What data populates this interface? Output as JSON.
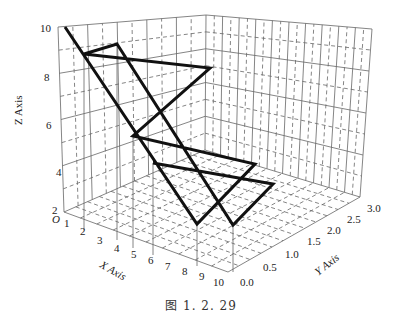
{
  "caption": "图 1. 2. 29",
  "axes": {
    "x_title": "X Axis",
    "y_title": "Y Axis",
    "z_title": "Z Axis",
    "origin_label": "O",
    "x_ticks": [
      "1",
      "2",
      "3",
      "4",
      "5",
      "6",
      "7",
      "8",
      "9",
      "10"
    ],
    "y_ticks": [
      "0.0",
      "0.5",
      "1.0",
      "1.5",
      "2.0",
      "2.5",
      "3.0"
    ],
    "z_ticks": [
      "2",
      "4",
      "6",
      "8",
      "10"
    ]
  },
  "colors": {
    "line": "#111111",
    "grid": "#555555",
    "background": "#ffffff"
  },
  "chart_data": {
    "type": "line",
    "subtype": "3d-line",
    "title": "",
    "caption": "图 1. 2. 29",
    "xlabel": "X Axis",
    "ylabel": "Y Axis",
    "zlabel": "Z Axis",
    "xlim": [
      0,
      10
    ],
    "ylim": [
      0.0,
      3.0
    ],
    "zlim": [
      2,
      10
    ],
    "x_ticks": [
      1,
      2,
      3,
      4,
      5,
      6,
      7,
      8,
      9,
      10
    ],
    "y_ticks": [
      0.0,
      0.5,
      1.0,
      1.5,
      2.0,
      2.5,
      3.0
    ],
    "z_ticks": [
      2,
      4,
      6,
      8,
      10
    ],
    "grid": true,
    "legend": null,
    "screen_polyline": [
      [
        65,
        27
      ],
      [
        197,
        224
      ],
      [
        255,
        164
      ],
      [
        133,
        136
      ],
      [
        210,
        68
      ],
      [
        84,
        54
      ],
      [
        117,
        44
      ],
      [
        233,
        225
      ],
      [
        273,
        184
      ],
      [
        153,
        163
      ]
    ],
    "series": [
      {
        "name": "line",
        "points_xyz_estimated": [
          [
            1,
            0.0,
            10
          ],
          [
            8,
            0.0,
            2.5
          ],
          [
            8,
            1.5,
            3.5
          ],
          [
            4,
            0.5,
            5.5
          ],
          [
            5,
            2.5,
            7
          ],
          [
            2,
            0.0,
            9
          ],
          [
            3,
            0.5,
            9
          ],
          [
            9,
            0.5,
            2.5
          ],
          [
            9,
            2.0,
            3
          ],
          [
            5,
            1.0,
            4
          ]
        ]
      }
    ]
  }
}
